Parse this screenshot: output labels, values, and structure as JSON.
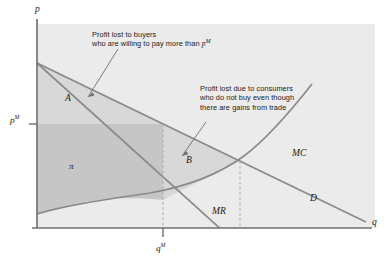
{
  "figure": {
    "type": "economics-diagram"
  },
  "axes": {
    "y_label": "p",
    "x_label": "q",
    "y_tick_label": "p",
    "y_tick_sup": "M",
    "x_tick_label": "q",
    "x_tick_sup": "M"
  },
  "curves": [
    {
      "name": "MC",
      "label": "MC"
    },
    {
      "name": "MR",
      "label": "MR"
    },
    {
      "name": "D",
      "label": "D"
    }
  ],
  "regions": [
    {
      "name": "A",
      "label": "A"
    },
    {
      "name": "B",
      "label": "B"
    },
    {
      "name": "profit",
      "label": "π"
    }
  ],
  "annotations": [
    {
      "id": "annotation-buyers",
      "line1": "Profit lost to buyers",
      "line2_before": "who are willing to pay more than ",
      "line2_var": "p",
      "line2_sup": "M"
    },
    {
      "id": "annotation-consumers",
      "line1": "Profit lost due to consumers",
      "line2": "who do not buy even though",
      "line3": "there are gains from trade"
    }
  ],
  "colors": {
    "plot_background": "#ebebeb",
    "region_a_fill": "#d8d8d8",
    "region_b_fill": "#d8d8d8",
    "profit_fill": "#c6c6c6",
    "curve_stroke": "#8a8a8a",
    "axis_stroke": "#6e6e6e",
    "dash_stroke": "#a8a8a8",
    "text": "#1b1b1b"
  }
}
